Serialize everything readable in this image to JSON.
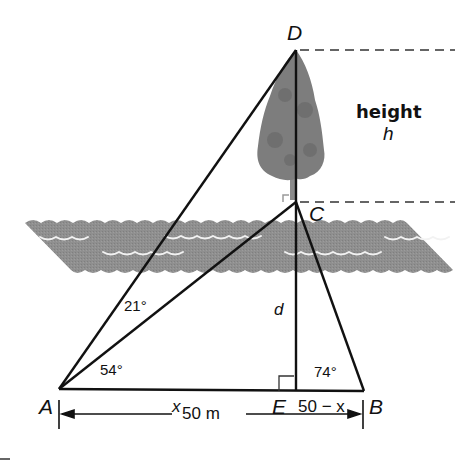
{
  "diagram": {
    "type": "geometry",
    "points": {
      "A": "A",
      "B": "B",
      "C": "C",
      "D": "D",
      "E": "E"
    },
    "angles": {
      "DAC": "21°",
      "CAB": "54°",
      "CBA": "74°"
    },
    "segments": {
      "AE": "x",
      "EB": "50 − x",
      "CE": "d",
      "AB": "50 m"
    },
    "height_label": "height",
    "height_var": "h",
    "colors": {
      "river": "#8c8c8c",
      "tree": "#7a7a7a",
      "line": "#111111"
    }
  }
}
